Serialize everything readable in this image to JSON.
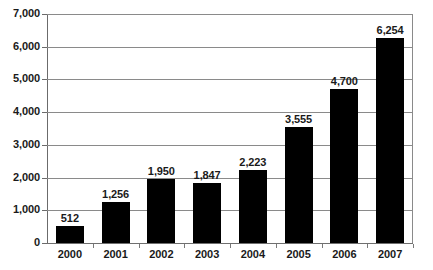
{
  "chart_data": {
    "type": "bar",
    "title": "",
    "xlabel": "",
    "ylabel": "",
    "categories": [
      "2000",
      "2001",
      "2002",
      "2003",
      "2004",
      "2005",
      "2006",
      "2007"
    ],
    "values": [
      512,
      1256,
      1950,
      1847,
      2223,
      3555,
      4700,
      6254
    ],
    "value_labels": [
      "512",
      "1,256",
      "1,950",
      "1,847",
      "2,223",
      "3,555",
      "4,700",
      "6,254"
    ],
    "ylim": [
      0,
      7000
    ],
    "ytick_values": [
      0,
      1000,
      2000,
      3000,
      4000,
      5000,
      6000,
      7000
    ],
    "ytick_labels": [
      "0",
      "1,000",
      "2,000",
      "3,000",
      "4,000",
      "5,000",
      "6,000",
      "7,000"
    ],
    "grid": true,
    "legend": false,
    "legend_position": "none",
    "bar_color": "#000000",
    "gridline_color": "#8a8a8a",
    "axis_color": "#6b6b6b",
    "text_color": "#1a1a1a"
  },
  "clipped_title": ""
}
